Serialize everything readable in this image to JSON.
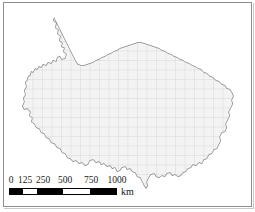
{
  "figure": {
    "type": "map",
    "region_name": "Tibetan Plateau",
    "background_color": "#ffffff",
    "frame_color": "#8d8d8d"
  },
  "map": {
    "fill_color": "#f2f2f2",
    "outline_color": "#8a8a8a",
    "grid_color": "#d8d8d8",
    "grid_spacing_px": 9.5,
    "grid_visible": true
  },
  "scalebar": {
    "unit_label": "km",
    "ticks": [
      {
        "label": "0",
        "position_pct": 0
      },
      {
        "label": "125",
        "position_pct": 12.5
      },
      {
        "label": "250",
        "position_pct": 25
      },
      {
        "label": "500",
        "position_pct": 50
      },
      {
        "label": "750",
        "position_pct": 75
      },
      {
        "label": "1000",
        "position_pct": 100
      }
    ],
    "segments": [
      {
        "fill": "#000000",
        "span_pct": 12.5
      },
      {
        "fill": "#ffffff",
        "span_pct": 12.5
      },
      {
        "fill": "#000000",
        "span_pct": 25
      },
      {
        "fill": "#ffffff",
        "span_pct": 25
      },
      {
        "fill": "#000000",
        "span_pct": 25
      }
    ],
    "min_value": 0,
    "max_value": 1000
  }
}
